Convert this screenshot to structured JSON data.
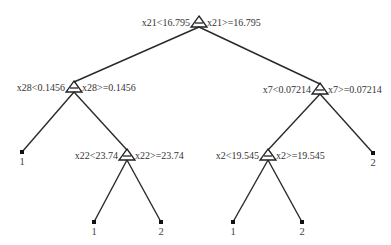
{
  "diagram": {
    "type": "decision-tree",
    "colors": {
      "line": "#2a2a2a",
      "text": "#333333",
      "background": "#ffffff"
    },
    "nodes": [
      {
        "id": "root",
        "kind": "split",
        "x": 199,
        "y": 22,
        "left_label": "x21<16.795",
        "right_label": "x21>=16.795"
      },
      {
        "id": "n_x28",
        "kind": "split",
        "x": 74,
        "y": 87,
        "left_label": "x28<0.1456",
        "right_label": "x28>=0.1456"
      },
      {
        "id": "n_x7",
        "kind": "split",
        "x": 320,
        "y": 89,
        "left_label": "x7<0.07214",
        "right_label": "x7>=0.07214"
      },
      {
        "id": "n_x22",
        "kind": "split",
        "x": 127,
        "y": 155,
        "left_label": "x22<23.74",
        "right_label": "x22>=23.74"
      },
      {
        "id": "n_x2",
        "kind": "split",
        "x": 268,
        "y": 155,
        "left_label": "x2<19.545",
        "right_label": "x2>=19.545"
      },
      {
        "id": "leaf_a",
        "kind": "leaf",
        "x": 22,
        "y": 152,
        "label": "1"
      },
      {
        "id": "leaf_b",
        "kind": "leaf",
        "x": 94,
        "y": 222,
        "label": "1"
      },
      {
        "id": "leaf_c",
        "kind": "leaf",
        "x": 161,
        "y": 222,
        "label": "2"
      },
      {
        "id": "leaf_d",
        "kind": "leaf",
        "x": 233,
        "y": 222,
        "label": "1"
      },
      {
        "id": "leaf_e",
        "kind": "leaf",
        "x": 302,
        "y": 222,
        "label": "2"
      },
      {
        "id": "leaf_f",
        "kind": "leaf",
        "x": 373,
        "y": 153,
        "label": "2"
      }
    ],
    "edges": [
      [
        "root",
        "n_x28"
      ],
      [
        "root",
        "n_x7"
      ],
      [
        "n_x28",
        "leaf_a"
      ],
      [
        "n_x28",
        "n_x22"
      ],
      [
        "n_x22",
        "leaf_b"
      ],
      [
        "n_x22",
        "leaf_c"
      ],
      [
        "n_x7",
        "n_x2"
      ],
      [
        "n_x7",
        "leaf_f"
      ],
      [
        "n_x2",
        "leaf_d"
      ],
      [
        "n_x2",
        "leaf_e"
      ]
    ]
  }
}
